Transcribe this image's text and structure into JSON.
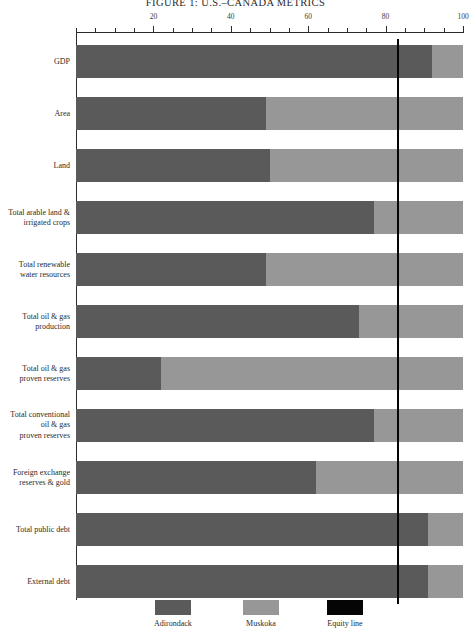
{
  "figure": {
    "title": "FIGURE 1: U.S.–CANADA METRICS"
  },
  "legend": {
    "position": "bottom",
    "items": [
      {
        "label": "Adirondack",
        "color": "#5a5a5a",
        "name": "legend-adirondack"
      },
      {
        "label": "Muskoka",
        "color": "#979797",
        "name": "legend-muskoka"
      },
      {
        "label": "Equity line",
        "color": "#050505",
        "name": "legend-equity-line"
      }
    ]
  },
  "axis": {
    "major_ticks": [
      "20",
      "40",
      "60",
      "80",
      "100"
    ],
    "major_values": [
      20,
      40,
      60,
      80,
      100
    ],
    "minor_step": 5,
    "min": 0,
    "max": 100
  },
  "chart_data": {
    "type": "bar",
    "orientation": "horizontal",
    "stacked": true,
    "title": "FIGURE 1: U.S.–CANADA METRICS",
    "xlabel": "",
    "ylabel": "",
    "xlim": [
      0,
      100
    ],
    "grid": false,
    "legend_position": "bottom",
    "annotations": [
      {
        "type": "vertical-line",
        "label": "Equity line",
        "value": 83,
        "color": "#050505"
      }
    ],
    "categories": [
      "GDP",
      "Area",
      "Land",
      "Total arable land &\nirrigated crops",
      "Total renewable\nwater resources",
      "Total oil & gas\nproduction",
      "Total oil & gas\nproven reserves",
      "Total conventional\noil & gas\nproven reserves",
      "Foreign exchange\nreserves & gold",
      "Total public debt",
      "External debt"
    ],
    "series": [
      {
        "name": "Adirondack",
        "color": "#5a5a5a",
        "values": [
          92,
          49,
          50,
          77,
          49,
          73,
          22,
          77,
          62,
          91,
          91
        ]
      },
      {
        "name": "Muskoka",
        "color": "#979797",
        "values": [
          8,
          51,
          50,
          23,
          51,
          27,
          78,
          23,
          38,
          9,
          9
        ]
      }
    ]
  },
  "rows": [
    {
      "label": "GDP",
      "a": 92,
      "b": 100,
      "top": 12,
      "height": 33
    },
    {
      "label": "Area",
      "a": 49,
      "b": 100,
      "top": 64,
      "height": 33
    },
    {
      "label": "Land",
      "a": 50,
      "b": 100,
      "top": 116,
      "height": 33
    },
    {
      "label": "Total arable land &\nirrigated crops",
      "a": 77,
      "b": 100,
      "top": 168,
      "height": 33
    },
    {
      "label": "Total renewable\nwater resources",
      "a": 49,
      "b": 100,
      "top": 220,
      "height": 33
    },
    {
      "label": "Total oil & gas\nproduction",
      "a": 73,
      "b": 100,
      "top": 272,
      "height": 33
    },
    {
      "label": "Total oil & gas\nproven reserves",
      "a": 22,
      "b": 100,
      "top": 324,
      "height": 33
    },
    {
      "label": "Total conventional\noil & gas\nproven reserves",
      "a": 77,
      "b": 100,
      "top": 376,
      "height": 33
    },
    {
      "label": "Foreign exchange\nreserves & gold",
      "a": 62,
      "b": 100,
      "top": 428,
      "height": 33
    },
    {
      "label": "Total public debt",
      "a": 91,
      "b": 100,
      "top": 480,
      "height": 33
    },
    {
      "label": "External debt",
      "a": 91,
      "b": 100,
      "top": 532,
      "height": 33
    }
  ],
  "equity": {
    "value": 83
  }
}
